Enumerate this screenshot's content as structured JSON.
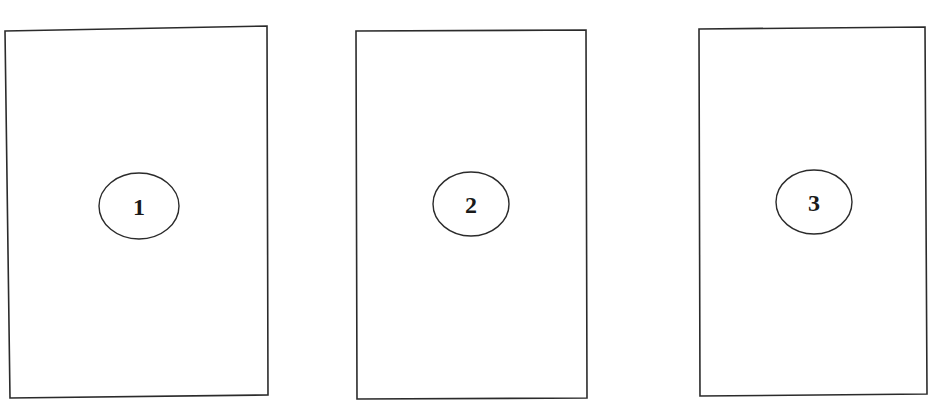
{
  "diagram": {
    "panels": [
      {
        "id": 1,
        "label": "1",
        "frame": {
          "points": "5,31 267,26 268,395 10,398"
        },
        "ellipse": {
          "cx": 139,
          "cy": 206,
          "rx": 40,
          "ry": 33
        }
      },
      {
        "id": 2,
        "label": "2",
        "frame": {
          "points": "356,31 586,30 587,398 357,399"
        },
        "ellipse": {
          "cx": 471,
          "cy": 204,
          "rx": 38,
          "ry": 32
        }
      },
      {
        "id": 3,
        "label": "3",
        "frame": {
          "points": "699,29 925,27 927,394 700,396"
        },
        "ellipse": {
          "cx": 814,
          "cy": 202,
          "rx": 38,
          "ry": 32
        }
      }
    ],
    "colors": {
      "stroke": "#2b2b2b",
      "background": "#ffffff",
      "text": "#1a1a1a"
    }
  }
}
